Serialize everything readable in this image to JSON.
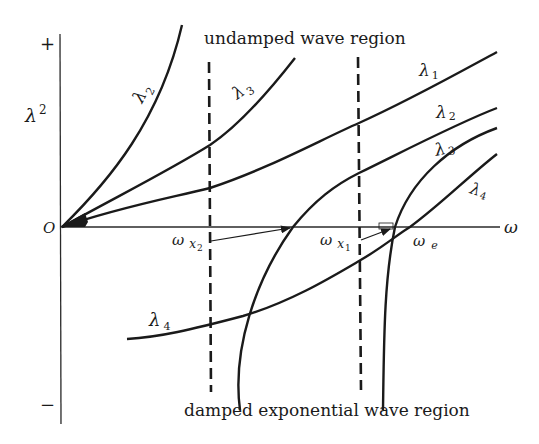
{
  "diagram": {
    "y_axis": {
      "label": "λ",
      "label_sup": "2",
      "plus": "+",
      "minus": "−"
    },
    "x_axis": {
      "label": "ω",
      "origin": "O"
    },
    "regions": {
      "top": "undamped wave region",
      "bottom": "damped exponential wave region"
    },
    "curves": [
      {
        "id": "lambda2-steep",
        "label": "λ",
        "sub": "2"
      },
      {
        "id": "lambda3-upper",
        "label": "λ",
        "sub": "3"
      },
      {
        "id": "lambda1",
        "label": "λ",
        "sub": "1"
      },
      {
        "id": "lambda2-lower",
        "label": "λ",
        "sub": "2"
      },
      {
        "id": "lambda3-lower",
        "label": "λ",
        "sub": "3"
      },
      {
        "id": "lambda4-right",
        "label": "λ",
        "sub": "4"
      },
      {
        "id": "lambda4-left",
        "label": "λ",
        "sub": "4"
      }
    ],
    "markers": [
      {
        "id": "omega-x2",
        "label": "ω",
        "sub": "x",
        "subsub": "2"
      },
      {
        "id": "omega-x1",
        "label": "ω",
        "sub": "x",
        "subsub": "1"
      },
      {
        "id": "omega-e",
        "label": "ω",
        "sub": "e"
      }
    ]
  }
}
